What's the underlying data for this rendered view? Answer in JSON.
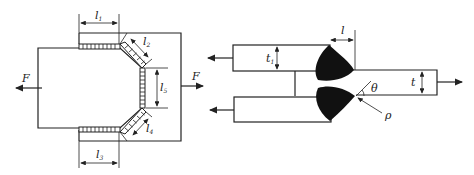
{
  "left_figure": {
    "force_left": "F",
    "force_right": "F",
    "dimensions": [
      {
        "symbol": "l",
        "subscript": "1"
      },
      {
        "symbol": "l",
        "subscript": "2"
      },
      {
        "symbol": "l",
        "subscript": "5"
      },
      {
        "symbol": "l",
        "subscript": "4"
      },
      {
        "symbol": "l",
        "subscript": "3"
      }
    ]
  },
  "right_figure": {
    "length_label": "l",
    "upper_thickness": {
      "symbol": "t",
      "subscript": "1"
    },
    "plate_thickness": "t",
    "angle_label": "θ",
    "radius_label": "ρ"
  },
  "colors": {
    "line": "#222222",
    "weld_fill": "#111111",
    "background": "#ffffff"
  }
}
